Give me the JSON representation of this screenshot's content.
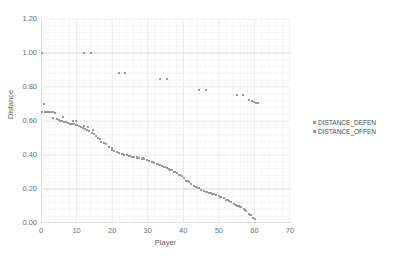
{
  "chart_data": {
    "type": "scatter",
    "title": "",
    "xlabel": "Player",
    "ylabel": "Distance",
    "xlim": [
      0,
      70
    ],
    "ylim": [
      0.0,
      1.2
    ],
    "xticks": [
      "0",
      "10",
      "20",
      "30",
      "40",
      "50",
      "60",
      "70"
    ],
    "xtick_values": [
      0,
      10,
      20,
      30,
      40,
      50,
      60,
      70
    ],
    "yticks": [
      "0.00",
      "0.20",
      "0.40",
      "0.60",
      "0.80",
      "1.00",
      "1.20"
    ],
    "ytick_values": [
      0.0,
      0.2,
      0.4,
      0.6,
      0.8,
      1.0,
      1.2
    ],
    "grid": true,
    "grid_minor": true,
    "legend_position": "right",
    "marker_color": "#9a9a9a",
    "grid_color": "#e8e8ef",
    "grid_minor_color": "#f2f2f7",
    "axis_color": "#c9c9c9",
    "series": [
      {
        "name": "DISTANCE_DEFEN",
        "color": "#9a9a9a",
        "marker": "square",
        "points": [
          [
            0.4,
            1.0
          ],
          [
            12.0,
            1.0
          ],
          [
            14.0,
            1.0
          ],
          [
            22.0,
            0.885
          ],
          [
            23.6,
            0.885
          ],
          [
            33.5,
            0.845
          ],
          [
            35.5,
            0.845
          ],
          [
            44.5,
            0.785
          ],
          [
            46.5,
            0.785
          ],
          [
            55.0,
            0.755
          ],
          [
            56.8,
            0.755
          ],
          [
            58.5,
            0.725
          ],
          [
            59.2,
            0.718
          ],
          [
            59.8,
            0.712
          ],
          [
            60.4,
            0.708
          ],
          [
            61.0,
            0.705
          ]
        ]
      },
      {
        "name": "DISTANCE_OFFEN",
        "color": "#9a9a9a",
        "marker": "square",
        "points": [
          [
            0.8,
            0.7
          ],
          [
            0.4,
            0.655
          ],
          [
            1.0,
            0.655
          ],
          [
            1.6,
            0.655
          ],
          [
            2.2,
            0.655
          ],
          [
            2.8,
            0.655
          ],
          [
            3.3,
            0.652
          ],
          [
            3.8,
            0.65
          ],
          [
            3.4,
            0.62
          ],
          [
            4.4,
            0.612
          ],
          [
            5.0,
            0.605
          ],
          [
            5.4,
            0.6
          ],
          [
            5.9,
            0.598
          ],
          [
            6.5,
            0.596
          ],
          [
            7.0,
            0.594
          ],
          [
            6.2,
            0.625
          ],
          [
            7.6,
            0.588
          ],
          [
            8.2,
            0.585
          ],
          [
            8.7,
            0.582
          ],
          [
            9.2,
            0.58
          ],
          [
            9.7,
            0.578
          ],
          [
            10.2,
            0.574
          ],
          [
            10.7,
            0.57
          ],
          [
            11.2,
            0.566
          ],
          [
            9.0,
            0.6
          ],
          [
            9.8,
            0.598
          ],
          [
            11.8,
            0.56
          ],
          [
            12.4,
            0.552
          ],
          [
            13.0,
            0.545
          ],
          [
            13.6,
            0.54
          ],
          [
            12.1,
            0.572
          ],
          [
            13.2,
            0.566
          ],
          [
            14.2,
            0.53
          ],
          [
            14.8,
            0.522
          ],
          [
            15.4,
            0.512
          ],
          [
            14.6,
            0.545
          ],
          [
            16.0,
            0.5
          ],
          [
            16.6,
            0.492
          ],
          [
            17.6,
            0.47
          ],
          [
            18.4,
            0.462
          ],
          [
            16.8,
            0.478
          ],
          [
            19.2,
            0.448
          ],
          [
            19.9,
            0.44
          ],
          [
            20.6,
            0.425
          ],
          [
            21.3,
            0.418
          ],
          [
            20.0,
            0.432
          ],
          [
            22.0,
            0.41
          ],
          [
            22.7,
            0.405
          ],
          [
            23.4,
            0.4
          ],
          [
            24.1,
            0.398
          ],
          [
            24.8,
            0.394
          ],
          [
            25.5,
            0.39
          ],
          [
            26.2,
            0.388
          ],
          [
            26.9,
            0.385
          ],
          [
            27.6,
            0.382
          ],
          [
            28.3,
            0.378
          ],
          [
            29.0,
            0.375
          ],
          [
            29.7,
            0.37
          ],
          [
            23.0,
            0.404
          ],
          [
            25.0,
            0.396
          ],
          [
            27.0,
            0.386
          ],
          [
            28.6,
            0.38
          ],
          [
            30.4,
            0.365
          ],
          [
            31.1,
            0.36
          ],
          [
            31.8,
            0.352
          ],
          [
            32.5,
            0.348
          ],
          [
            33.2,
            0.342
          ],
          [
            33.9,
            0.336
          ],
          [
            34.6,
            0.33
          ],
          [
            35.3,
            0.324
          ],
          [
            31.4,
            0.356
          ],
          [
            33.5,
            0.34
          ],
          [
            34.9,
            0.328
          ],
          [
            36.0,
            0.318
          ],
          [
            36.7,
            0.31
          ],
          [
            37.4,
            0.302
          ],
          [
            38.1,
            0.295
          ],
          [
            36.4,
            0.314
          ],
          [
            37.8,
            0.298
          ],
          [
            38.8,
            0.285
          ],
          [
            39.5,
            0.275
          ],
          [
            40.2,
            0.265
          ],
          [
            39.2,
            0.28
          ],
          [
            40.9,
            0.25
          ],
          [
            41.6,
            0.24
          ],
          [
            42.3,
            0.232
          ],
          [
            41.2,
            0.245
          ],
          [
            43.0,
            0.22
          ],
          [
            43.7,
            0.212
          ],
          [
            44.4,
            0.205
          ],
          [
            44.0,
            0.208
          ],
          [
            45.1,
            0.195
          ],
          [
            45.8,
            0.188
          ],
          [
            46.5,
            0.182
          ],
          [
            47.2,
            0.178
          ],
          [
            47.9,
            0.174
          ],
          [
            48.6,
            0.17
          ],
          [
            49.3,
            0.166
          ],
          [
            46.8,
            0.18
          ],
          [
            48.2,
            0.172
          ],
          [
            50.0,
            0.158
          ],
          [
            50.7,
            0.152
          ],
          [
            51.4,
            0.148
          ],
          [
            50.4,
            0.155
          ],
          [
            52.1,
            0.138
          ],
          [
            52.8,
            0.13
          ],
          [
            53.5,
            0.122
          ],
          [
            52.5,
            0.134
          ],
          [
            54.2,
            0.112
          ],
          [
            54.9,
            0.104
          ],
          [
            55.6,
            0.098
          ],
          [
            56.3,
            0.092
          ],
          [
            55.0,
            0.102
          ],
          [
            56.0,
            0.095
          ],
          [
            57.0,
            0.08
          ],
          [
            57.7,
            0.072
          ],
          [
            57.4,
            0.076
          ],
          [
            58.4,
            0.055
          ],
          [
            59.0,
            0.045
          ],
          [
            58.8,
            0.05
          ],
          [
            59.6,
            0.03
          ],
          [
            60.1,
            0.022
          ]
        ]
      }
    ]
  },
  "legend": {
    "entries": [
      {
        "label": "DISTANCE_DEFEN",
        "color": "#9a9a9a"
      },
      {
        "label": "DISTANCE_OFFEN",
        "color": "#9a9a9a"
      }
    ]
  }
}
